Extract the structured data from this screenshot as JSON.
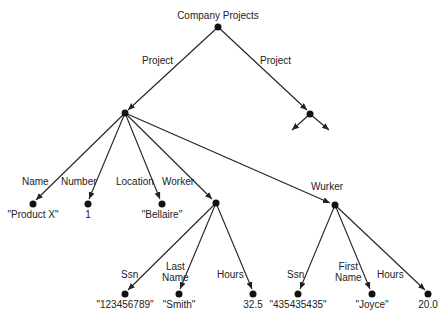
{
  "diagram": {
    "root": {
      "label": "Company Projects"
    },
    "edges": {
      "project_left": "Project",
      "project_right": "Project",
      "name": "Name",
      "number": "Number",
      "location": "Location",
      "worker1": "Worker",
      "worker2": "Wurker",
      "w1_ssn": "Ssn",
      "w1_lastname_line1": "Last",
      "w1_lastname_line2": "Name",
      "w1_hours": "Hours",
      "w2_ssn": "Ssn",
      "w2_firstname_line1": "First",
      "w2_firstname_line2": "Name",
      "w2_hours": "Hours"
    },
    "values": {
      "name": "\"Product X\"",
      "number": "1",
      "location": "\"Bellaire\"",
      "w1_ssn": "\"123456789\"",
      "w1_lastname": "\"Smith\"",
      "w1_hours": "32.5",
      "w2_ssn": "\"435435435\"",
      "w2_firstname": "\"Joyce\"",
      "w2_hours": "20.0"
    },
    "colors": {
      "line": "#222222",
      "node": "#111111",
      "background": "#ffffff"
    }
  }
}
